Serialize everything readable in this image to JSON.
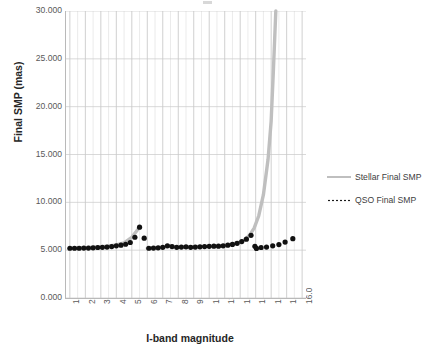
{
  "chart_data": {
    "type": "scatter",
    "title": "",
    "xlabel": "I-band magnitude",
    "ylabel": "Final SMP (mas)",
    "xlim": [
      0.75,
      16.25
    ],
    "ylim": [
      0,
      30
    ],
    "grid": true,
    "legend_position": "right",
    "y_ticks": [
      "0.000",
      "5.000",
      "10.000",
      "15.000",
      "20.000",
      "25.000",
      "30.000"
    ],
    "y_tick_values": [
      0,
      5,
      10,
      15,
      20,
      25,
      30
    ],
    "x_ticks": [
      "1.0",
      "2.0",
      "3.0",
      "4.0",
      "5.0",
      "6.0",
      "7.0",
      "8.0",
      "9.0",
      "10.0",
      "11.0",
      "12.0",
      "13.0",
      "14.0",
      "15.0",
      "16.0"
    ],
    "x_tick_values": [
      1,
      2,
      3,
      4,
      5,
      6,
      7,
      8,
      9,
      10,
      11,
      12,
      13,
      14,
      15,
      16
    ],
    "x_minor_tick_step": 0.5,
    "series": [
      {
        "name": "Stellar Final SMP",
        "style": "solid-line",
        "color": "#bfbfbf",
        "x": [
          1.0,
          1.5,
          2.0,
          2.5,
          3.0,
          3.5,
          4.0,
          4.5,
          5.0,
          5.5,
          6.0,
          6.5,
          7.0,
          7.5,
          8.0,
          8.5,
          9.0,
          9.5,
          10.0,
          10.5,
          11.0,
          11.5,
          12.0,
          12.3,
          12.6,
          12.9,
          13.2,
          13.5,
          13.8,
          14.0,
          14.15,
          14.3
        ],
        "y": [
          5.2,
          5.25,
          5.25,
          5.3,
          5.35,
          5.45,
          5.55,
          5.75,
          6.35,
          7.4,
          5.2,
          5.25,
          5.3,
          5.45,
          5.3,
          5.35,
          5.35,
          5.4,
          5.4,
          5.45,
          5.5,
          5.65,
          5.85,
          6.1,
          6.55,
          7.3,
          8.6,
          10.8,
          14.5,
          18.5,
          24.0,
          30.0
        ]
      },
      {
        "name": "QSO Final SMP",
        "style": "dotted-markers",
        "color": "#111111",
        "x": [
          1.0,
          1.3,
          1.6,
          1.9,
          2.2,
          2.5,
          2.8,
          3.1,
          3.4,
          3.7,
          4.0,
          4.3,
          4.6,
          4.9,
          5.2,
          5.5,
          5.8,
          6.1,
          6.4,
          6.7,
          7.0,
          7.3,
          7.6,
          7.9,
          8.2,
          8.5,
          8.8,
          9.1,
          9.4,
          9.7,
          10.0,
          10.3,
          10.6,
          10.9,
          11.2,
          11.5,
          11.8,
          12.1,
          12.4,
          12.7,
          12.95,
          13.05,
          13.35,
          13.7,
          14.1,
          14.5,
          14.9,
          15.4
        ],
        "y": [
          5.2,
          5.2,
          5.2,
          5.22,
          5.22,
          5.25,
          5.28,
          5.3,
          5.32,
          5.38,
          5.45,
          5.52,
          5.62,
          5.8,
          6.35,
          7.4,
          6.25,
          5.2,
          5.22,
          5.25,
          5.3,
          5.45,
          5.38,
          5.3,
          5.32,
          5.35,
          5.3,
          5.32,
          5.35,
          5.38,
          5.4,
          5.42,
          5.42,
          5.45,
          5.52,
          5.6,
          5.72,
          5.9,
          6.15,
          6.55,
          5.4,
          5.18,
          5.28,
          5.32,
          5.45,
          5.58,
          5.85,
          6.2
        ]
      }
    ]
  },
  "legend": {
    "items": [
      {
        "label": "Stellar Final SMP",
        "key": "solid"
      },
      {
        "label": "QSO Final SMP",
        "key": "dotted"
      }
    ]
  }
}
